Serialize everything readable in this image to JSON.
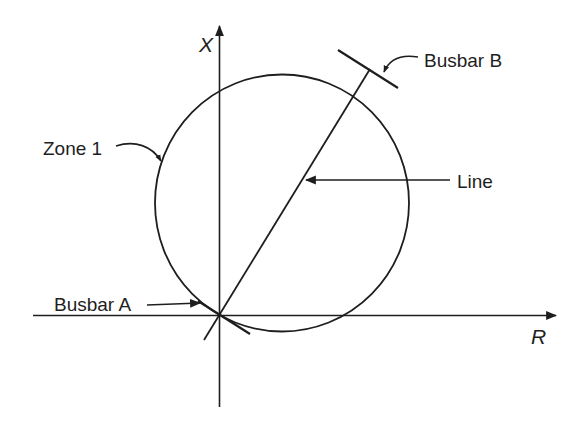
{
  "diagram": {
    "type": "distance-relay-impedance-characteristic",
    "axes": {
      "vertical": {
        "label": "X"
      },
      "horizontal": {
        "label": "R"
      }
    },
    "labels": {
      "zone": "Zone 1",
      "busbar_b": "Busbar B",
      "line": "Line",
      "busbar_a": "Busbar A"
    },
    "colors": {
      "ink": "#1e1e1e",
      "background": "#ffffff"
    }
  }
}
